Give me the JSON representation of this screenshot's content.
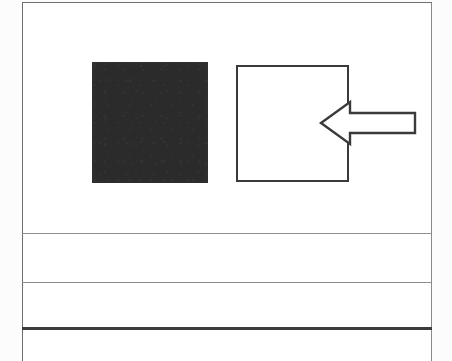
{
  "figure": {
    "type": "line-drawing",
    "caption": "",
    "background_color": "#ffffff",
    "frame": {
      "name": "figure-frame",
      "stroke_color": "#6f6f6f",
      "stroke_width_px": 1.5,
      "x": 22,
      "y": 2,
      "width": 410,
      "height": 359,
      "open_bottom": true
    },
    "shapes": [
      {
        "id": "filled-square",
        "label": "",
        "kind": "square",
        "fill": "#2b2b2b",
        "stroke": "none",
        "x": 70,
        "y": 60,
        "width": 116,
        "height": 121
      },
      {
        "id": "outlined-square",
        "label": "",
        "kind": "square",
        "fill": "none",
        "stroke": "#3a3a3a",
        "stroke_width_px": 2.4,
        "x": 214,
        "y": 63,
        "width": 113,
        "height": 117
      },
      {
        "id": "left-arrow",
        "label": "",
        "kind": "arrow",
        "direction": "left",
        "fill": "#ffffff",
        "stroke": "#3a3a3a",
        "stroke_width_px": 2.4,
        "x": 296,
        "y": 94,
        "width": 100,
        "height": 54,
        "tip_x": 299,
        "tip_y": 121
      }
    ],
    "rules": [
      {
        "id": "rule-line-1",
        "y": 233,
        "thickness_px": 1.4,
        "color": "#8d8d8d"
      },
      {
        "id": "rule-line-2",
        "y": 282,
        "thickness_px": 1.4,
        "color": "#8d8d8d"
      },
      {
        "id": "rule-line-heavy",
        "y": 327,
        "thickness_px": 3.2,
        "color": "#3c3c3c"
      }
    ],
    "rows": [
      {
        "id": "ruled-row-1",
        "text": ""
      },
      {
        "id": "ruled-row-2",
        "text": ""
      },
      {
        "id": "ruled-row-3",
        "text": ""
      }
    ]
  }
}
